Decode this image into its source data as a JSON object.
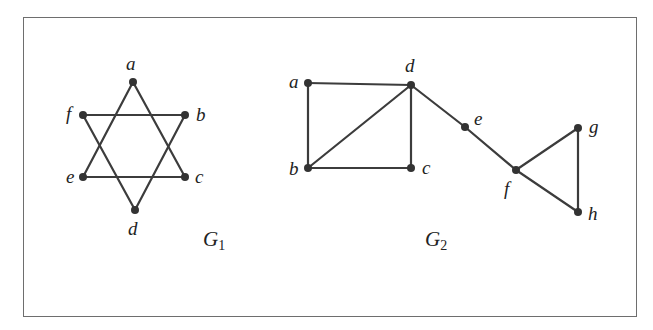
{
  "figure": {
    "graphs": [
      {
        "id": "G1",
        "label": "G",
        "subscript": "1",
        "label_pos": [
          203,
          246
        ],
        "nodes": [
          {
            "id": "a",
            "x": 133,
            "y": 82,
            "lx": 126,
            "ly": 70
          },
          {
            "id": "f",
            "x": 83,
            "y": 115,
            "lx": 66,
            "ly": 120
          },
          {
            "id": "b",
            "x": 185,
            "y": 115,
            "lx": 196,
            "ly": 121
          },
          {
            "id": "e",
            "x": 83,
            "y": 177,
            "lx": 66,
            "ly": 183
          },
          {
            "id": "c",
            "x": 185,
            "y": 177,
            "lx": 195,
            "ly": 183
          },
          {
            "id": "d",
            "x": 135,
            "y": 210,
            "lx": 128,
            "ly": 235
          }
        ],
        "edges": [
          [
            "a",
            "e"
          ],
          [
            "e",
            "c"
          ],
          [
            "c",
            "a"
          ],
          [
            "f",
            "b"
          ],
          [
            "b",
            "d"
          ],
          [
            "d",
            "f"
          ]
        ]
      },
      {
        "id": "G2",
        "label": "G",
        "subscript": "2",
        "label_pos": [
          425,
          246
        ],
        "nodes": [
          {
            "id": "a",
            "x": 308,
            "y": 83,
            "lx": 289,
            "ly": 88
          },
          {
            "id": "d",
            "x": 411,
            "y": 85,
            "lx": 405,
            "ly": 72
          },
          {
            "id": "b",
            "x": 308,
            "y": 168,
            "lx": 289,
            "ly": 175
          },
          {
            "id": "c",
            "x": 411,
            "y": 168,
            "lx": 422,
            "ly": 174
          },
          {
            "id": "e",
            "x": 465,
            "y": 127,
            "lx": 474,
            "ly": 125
          },
          {
            "id": "f",
            "x": 516,
            "y": 170,
            "lx": 504,
            "ly": 195
          },
          {
            "id": "g",
            "x": 578,
            "y": 128,
            "lx": 589,
            "ly": 133
          },
          {
            "id": "h",
            "x": 578,
            "y": 212,
            "lx": 588,
            "ly": 220
          }
        ],
        "edges": [
          [
            "a",
            "d"
          ],
          [
            "a",
            "b"
          ],
          [
            "b",
            "c"
          ],
          [
            "c",
            "d"
          ],
          [
            "b",
            "d"
          ],
          [
            "d",
            "e"
          ],
          [
            "e",
            "f"
          ],
          [
            "f",
            "g"
          ],
          [
            "g",
            "h"
          ],
          [
            "f",
            "h"
          ]
        ]
      }
    ],
    "colors": {
      "edge": "#3c3c3c",
      "node": "#333333",
      "frame": "#6e6e6e",
      "text": "#222222"
    }
  }
}
